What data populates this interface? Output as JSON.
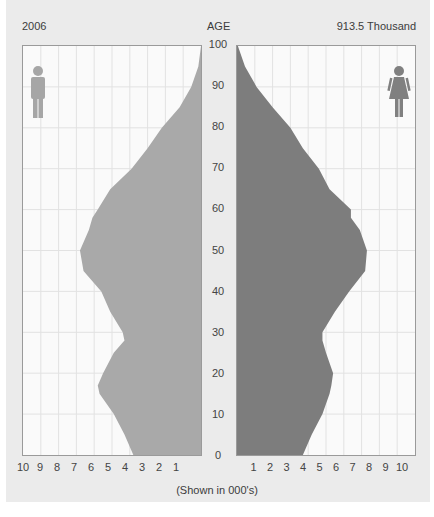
{
  "header": {
    "year": "2006",
    "age_title": "AGE",
    "total": "913.5 Thousand"
  },
  "caption": "(Shown in 000's)",
  "icons": {
    "left": "male-figure-icon",
    "right": "female-figure-icon"
  },
  "colors": {
    "background": "#ebebeb",
    "panel": "#fafafa",
    "grid": "#e2e2e2",
    "male_fill": "#a9a9a9",
    "female_fill": "#7d7d7d",
    "male_icon": "#a6a6a6",
    "female_icon": "#808080"
  },
  "axis": {
    "age_ticks": [
      "100",
      "90",
      "80",
      "70",
      "60",
      "50",
      "40",
      "30",
      "20",
      "10",
      "0"
    ],
    "left_x_ticks": [
      "10",
      "9",
      "8",
      "7",
      "6",
      "5",
      "4",
      "3",
      "2",
      "1"
    ],
    "right_x_ticks": [
      "1",
      "2",
      "3",
      "4",
      "5",
      "6",
      "7",
      "8",
      "9",
      "10"
    ]
  },
  "chart_data": {
    "type": "bar",
    "subtype": "population-pyramid",
    "title": "2006",
    "subtitle": "913.5 Thousand",
    "xlabel": "(Shown in 000's)",
    "ylabel": "AGE",
    "ylim": [
      0,
      100
    ],
    "xlim": [
      0,
      10
    ],
    "grid": true,
    "categories": [
      0,
      5,
      10,
      15,
      17,
      20,
      25,
      28,
      30,
      35,
      40,
      45,
      50,
      55,
      58,
      60,
      65,
      70,
      75,
      80,
      85,
      90,
      95,
      100
    ],
    "series": [
      {
        "name": "Male",
        "side": "left",
        "values": [
          3.8,
          4.3,
          4.9,
          5.7,
          5.8,
          5.5,
          4.9,
          4.3,
          4.4,
          5.1,
          5.6,
          6.6,
          6.8,
          6.3,
          6.1,
          5.8,
          5.1,
          3.9,
          3.0,
          2.2,
          1.2,
          0.55,
          0.15,
          0.0
        ]
      },
      {
        "name": "Female",
        "side": "right",
        "values": [
          3.7,
          4.2,
          4.8,
          5.2,
          5.3,
          5.4,
          5.0,
          4.8,
          4.8,
          5.5,
          6.3,
          7.2,
          7.3,
          6.9,
          6.4,
          6.4,
          5.2,
          4.6,
          3.7,
          3.0,
          2.0,
          1.1,
          0.45,
          0.05
        ]
      }
    ]
  }
}
